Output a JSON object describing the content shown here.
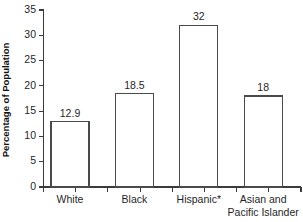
{
  "chart_data": {
    "type": "bar",
    "title": "",
    "subtitle": "",
    "xlabel": "",
    "ylabel": "Percentage of Population",
    "categories": [
      "White",
      "Black",
      "Hispanic*",
      "Asian and Pacific Islander"
    ],
    "category_lines": [
      [
        "White"
      ],
      [
        "Black"
      ],
      [
        "Hispanic*"
      ],
      [
        "Asian and",
        "Pacific Islander"
      ]
    ],
    "values": [
      12.9,
      18.5,
      32,
      18
    ],
    "value_labels": [
      "12.9",
      "18.5",
      "32",
      "18"
    ],
    "ylim": [
      0,
      35
    ],
    "ytick_values": [
      0,
      5,
      10,
      15,
      20,
      25,
      30,
      35
    ],
    "ytick_labels": [
      "0",
      "5",
      "10",
      "15",
      "20",
      "25",
      "30",
      "35"
    ],
    "grid": false,
    "legend": null,
    "legend_position": "none",
    "bar_fill_color": "#ffffff",
    "bar_edge_color": "#4a4a4a",
    "axis_color": "#3b3b3b",
    "text_color": "#1f1f1f",
    "background_color": "#ffffff",
    "annotations": [
      "*"
    ]
  }
}
